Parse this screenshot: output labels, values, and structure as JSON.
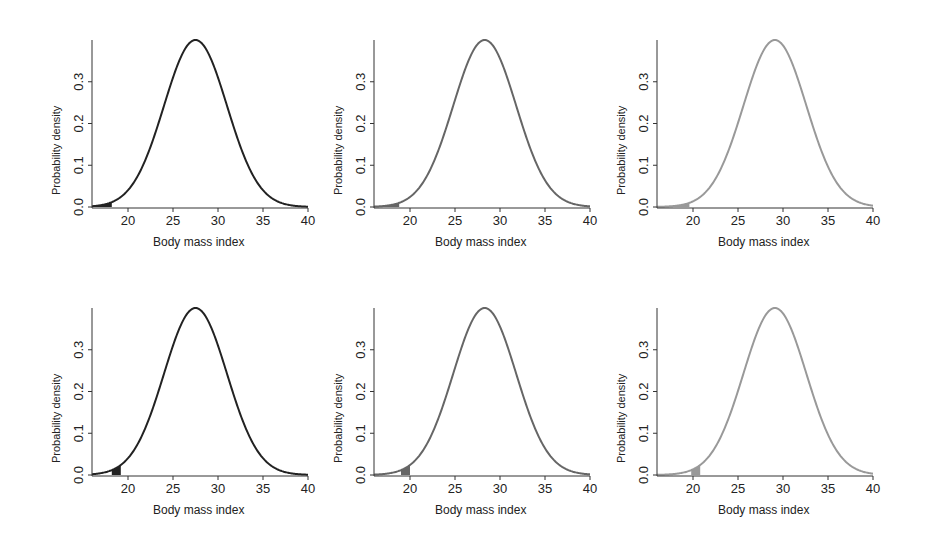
{
  "chart_data": [
    {
      "type": "line",
      "panel": "top-left",
      "xlabel": "Body mass index",
      "ylabel": "Probability density",
      "xlim": [
        16,
        40
      ],
      "ylim": [
        0,
        0.4
      ],
      "xticks": [
        20,
        25,
        30,
        35,
        40
      ],
      "yticks": [
        "0.0",
        "0.1",
        "0.2",
        "0.3"
      ],
      "mean": 27.5,
      "sd": 3.5,
      "peak": 0.4,
      "color": "#222222",
      "shaded": {
        "from": 16,
        "to": 18.2,
        "color": "#222222"
      }
    },
    {
      "type": "line",
      "panel": "top-middle",
      "xlabel": "Body mass index",
      "ylabel": "Probability density",
      "xlim": [
        16,
        40
      ],
      "ylim": [
        0,
        0.4
      ],
      "xticks": [
        20,
        25,
        30,
        35,
        40
      ],
      "yticks": [
        "0.0",
        "0.1",
        "0.2",
        "0.3"
      ],
      "mean": 28.3,
      "sd": 3.5,
      "peak": 0.4,
      "color": "#666666",
      "shaded": {
        "from": 16,
        "to": 18.8,
        "color": "#666666"
      }
    },
    {
      "type": "line",
      "panel": "top-right",
      "xlabel": "Body mass index",
      "ylabel": "Probability density",
      "xlim": [
        16,
        40
      ],
      "ylim": [
        0,
        0.4
      ],
      "xticks": [
        20,
        25,
        30,
        35,
        40
      ],
      "yticks": [
        "0.0",
        "0.1",
        "0.2",
        "0.3"
      ],
      "mean": 29.1,
      "sd": 3.5,
      "peak": 0.4,
      "color": "#999999",
      "shaded": {
        "from": 16,
        "to": 19.6,
        "color": "#999999"
      }
    },
    {
      "type": "line",
      "panel": "bottom-left",
      "xlabel": "Body mass index",
      "ylabel": "Probability density",
      "xlim": [
        16,
        40
      ],
      "ylim": [
        0,
        0.4
      ],
      "xticks": [
        20,
        25,
        30,
        35,
        40
      ],
      "yticks": [
        "0.0",
        "0.1",
        "0.2",
        "0.3"
      ],
      "mean": 27.5,
      "sd": 3.5,
      "peak": 0.4,
      "color": "#222222",
      "shaded": {
        "from": 18.2,
        "to": 19.2,
        "color": "#222222"
      }
    },
    {
      "type": "line",
      "panel": "bottom-middle",
      "xlabel": "Body mass index",
      "ylabel": "Probability density",
      "xlim": [
        16,
        40
      ],
      "ylim": [
        0,
        0.4
      ],
      "xticks": [
        20,
        25,
        30,
        35,
        40
      ],
      "yticks": [
        "0.0",
        "0.1",
        "0.2",
        "0.3"
      ],
      "mean": 28.3,
      "sd": 3.5,
      "peak": 0.4,
      "color": "#666666",
      "shaded": {
        "from": 19.0,
        "to": 20.0,
        "color": "#666666"
      }
    },
    {
      "type": "line",
      "panel": "bottom-right",
      "xlabel": "Body mass index",
      "ylabel": "Probability density",
      "xlim": [
        16,
        40
      ],
      "ylim": [
        0,
        0.4
      ],
      "xticks": [
        20,
        25,
        30,
        35,
        40
      ],
      "yticks": [
        "0.0",
        "0.1",
        "0.2",
        "0.3"
      ],
      "mean": 29.1,
      "sd": 3.5,
      "peak": 0.4,
      "color": "#999999",
      "shaded": {
        "from": 19.8,
        "to": 20.8,
        "color": "#999999"
      }
    }
  ],
  "panels": [
    {
      "xlabel": "Body mass index",
      "ylabel": "Probability density"
    },
    {
      "xlabel": "Body mass index",
      "ylabel": "Probability density"
    },
    {
      "xlabel": "Body mass index",
      "ylabel": "Probability density"
    },
    {
      "xlabel": "Body mass index",
      "ylabel": "Probability density"
    },
    {
      "xlabel": "Body mass index",
      "ylabel": "Probability density"
    },
    {
      "xlabel": "Body mass index",
      "ylabel": "Probability density"
    }
  ]
}
